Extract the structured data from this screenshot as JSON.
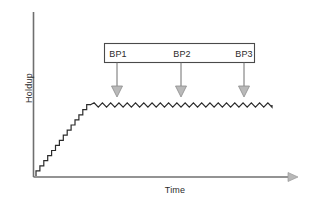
{
  "figure": {
    "background": "#ffffff",
    "line_color": "#2b2b2b",
    "arrow_color": "#8c8c8c",
    "box_border_color": "#4a4a4a"
  },
  "axes": {
    "ylabel": "Holdup",
    "xlabel": "Time",
    "x_axis_has_arrow": true,
    "y_axis_has_arrow": false
  },
  "annotation_box": {
    "x": 104,
    "y": 43,
    "width": 151,
    "height": 20,
    "labels": [
      {
        "text": "BP1",
        "arrow_x": 117,
        "arrow_top": 63,
        "arrow_bottom": 95
      },
      {
        "text": "BP2",
        "arrow_x": 181,
        "arrow_top": 63,
        "arrow_bottom": 95
      },
      {
        "text": "BP3",
        "arrow_x": 244,
        "arrow_top": 63,
        "arrow_bottom": 95
      }
    ]
  },
  "chart_data": {
    "type": "line",
    "title": "",
    "xlabel": "Time",
    "ylabel": "Holdup",
    "xlim": [
      0,
      1
    ],
    "ylim": [
      0,
      1
    ],
    "grid": false,
    "legend": null,
    "annotations": [
      "BP1",
      "BP2",
      "BP3"
    ],
    "series": [
      {
        "name": "Holdup",
        "style": "staircase-then-sawtooth-plateau",
        "ramp": {
          "x_start": 36,
          "y_start": 176,
          "x_end": 90,
          "y_end": 104,
          "n_steps": 14,
          "step_width_px": 3.9,
          "step_height_px": 5.1
        },
        "plateau": {
          "x_start": 90,
          "x_end": 272,
          "y_center": 105,
          "ripple_amplitude_px": 2.2,
          "ripple_count": 22
        }
      }
    ]
  }
}
